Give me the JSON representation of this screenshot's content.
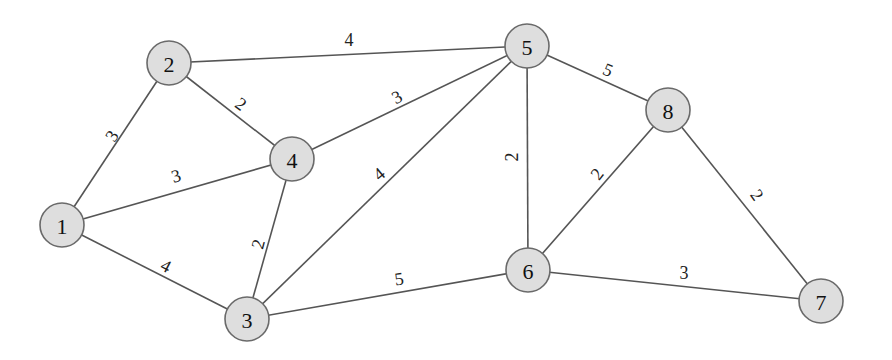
{
  "graph": {
    "nodes": [
      {
        "id": "1",
        "x": 62,
        "y": 225
      },
      {
        "id": "2",
        "x": 169,
        "y": 63
      },
      {
        "id": "3",
        "x": 247,
        "y": 319
      },
      {
        "id": "4",
        "x": 292,
        "y": 159
      },
      {
        "id": "5",
        "x": 527,
        "y": 46
      },
      {
        "id": "6",
        "x": 528,
        "y": 270
      },
      {
        "id": "7",
        "x": 821,
        "y": 301
      },
      {
        "id": "8",
        "x": 668,
        "y": 110
      }
    ],
    "edges": [
      {
        "from": "1",
        "to": "2",
        "weight": "3",
        "lx": 112,
        "ly": 136,
        "rot": -57
      },
      {
        "from": "1",
        "to": "4",
        "weight": "3",
        "lx": 176,
        "ly": 176,
        "rot": -17
      },
      {
        "from": "1",
        "to": "3",
        "weight": "4",
        "lx": 166,
        "ly": 266,
        "rot": 27
      },
      {
        "from": "2",
        "to": "4",
        "weight": "2",
        "lx": 241,
        "ly": 104,
        "rot": 36
      },
      {
        "from": "2",
        "to": "5",
        "weight": "4",
        "lx": 349,
        "ly": 40,
        "rot": 0
      },
      {
        "from": "4",
        "to": "3",
        "weight": "2",
        "lx": 258,
        "ly": 244,
        "rot": -75
      },
      {
        "from": "4",
        "to": "5",
        "weight": "3",
        "lx": 397,
        "ly": 97,
        "rot": -28
      },
      {
        "from": "3",
        "to": "5",
        "weight": "4",
        "lx": 379,
        "ly": 174,
        "rot": -40
      },
      {
        "from": "3",
        "to": "6",
        "weight": "5",
        "lx": 399,
        "ly": 279,
        "rot": -8
      },
      {
        "from": "5",
        "to": "6",
        "weight": "2",
        "lx": 512,
        "ly": 157,
        "rot": -90
      },
      {
        "from": "5",
        "to": "8",
        "weight": "5",
        "lx": 608,
        "ly": 70,
        "rot": 23
      },
      {
        "from": "8",
        "to": "6",
        "weight": "2",
        "lx": 597,
        "ly": 174,
        "rot": -52
      },
      {
        "from": "8",
        "to": "7",
        "weight": "2",
        "lx": 757,
        "ly": 195,
        "rot": 55
      },
      {
        "from": "6",
        "to": "7",
        "weight": "3",
        "lx": 684,
        "ly": 273,
        "rot": 0
      }
    ],
    "node_radius": 22,
    "colors": {
      "node_fill": "#dedede",
      "node_stroke": "#6a6a6a",
      "edge": "#555555"
    }
  }
}
